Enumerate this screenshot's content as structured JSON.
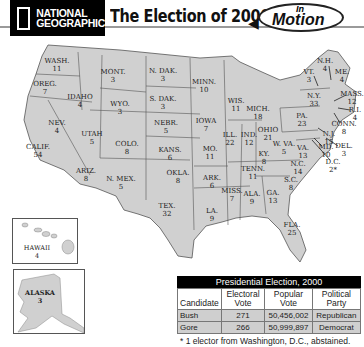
{
  "header": {
    "logo_line1": "NATIONAL",
    "logo_line2": "GEOGRAPHIC",
    "title": "The Election of 2000",
    "badge_small": "In",
    "badge_large": "Motion",
    "badge_icon": "arrow-left-icon"
  },
  "map": {
    "fill_color": "#d0d0d0",
    "border_color": "#555555",
    "states": [
      {
        "name": "WASH.",
        "votes": "11",
        "x": 57,
        "y": 62
      },
      {
        "name": "OREG.",
        "votes": "7",
        "x": 45,
        "y": 85
      },
      {
        "name": "CALIF.",
        "votes": "54",
        "x": 38,
        "y": 148
      },
      {
        "name": "NEV.",
        "votes": "4",
        "x": 57,
        "y": 124
      },
      {
        "name": "IDAHO",
        "votes": "4",
        "x": 80,
        "y": 98
      },
      {
        "name": "MONT.",
        "votes": "3",
        "x": 113,
        "y": 73
      },
      {
        "name": "WYO.",
        "votes": "3",
        "x": 120,
        "y": 105
      },
      {
        "name": "UTAH",
        "votes": "5",
        "x": 92,
        "y": 135
      },
      {
        "name": "COLO.",
        "votes": "8",
        "x": 127,
        "y": 145
      },
      {
        "name": "ARIZ.",
        "votes": "8",
        "x": 86,
        "y": 172
      },
      {
        "name": "N. MEX.",
        "votes": "5",
        "x": 121,
        "y": 180
      },
      {
        "name": "N. DAK.",
        "votes": "3",
        "x": 163,
        "y": 72
      },
      {
        "name": "S. DAK.",
        "votes": "3",
        "x": 163,
        "y": 100
      },
      {
        "name": "NEBR.",
        "votes": "5",
        "x": 166,
        "y": 124
      },
      {
        "name": "KANS.",
        "votes": "6",
        "x": 170,
        "y": 151
      },
      {
        "name": "OKLA.",
        "votes": "8",
        "x": 178,
        "y": 174
      },
      {
        "name": "TEX.",
        "votes": "32",
        "x": 167,
        "y": 207
      },
      {
        "name": "MINN.",
        "votes": "10",
        "x": 204,
        "y": 83
      },
      {
        "name": "IOWA",
        "votes": "7",
        "x": 206,
        "y": 122
      },
      {
        "name": "MO.",
        "votes": "11",
        "x": 210,
        "y": 150
      },
      {
        "name": "ARK.",
        "votes": "6",
        "x": 212,
        "y": 179
      },
      {
        "name": "LA.",
        "votes": "9",
        "x": 212,
        "y": 212
      },
      {
        "name": "WIS.",
        "votes": "11",
        "x": 236,
        "y": 102
      },
      {
        "name": "ILL.",
        "votes": "22",
        "x": 230,
        "y": 136
      },
      {
        "name": "MICH.",
        "votes": "18",
        "x": 258,
        "y": 110
      },
      {
        "name": "IND.",
        "votes": "12",
        "x": 249,
        "y": 136
      },
      {
        "name": "OHIO",
        "votes": "21",
        "x": 268,
        "y": 131
      },
      {
        "name": "KY.",
        "votes": "8",
        "x": 264,
        "y": 155
      },
      {
        "name": "TENN.",
        "votes": "11",
        "x": 253,
        "y": 170
      },
      {
        "name": "MISS.",
        "votes": "7",
        "x": 232,
        "y": 192
      },
      {
        "name": "ALA.",
        "votes": "9",
        "x": 252,
        "y": 195
      },
      {
        "name": "GA.",
        "votes": "13",
        "x": 273,
        "y": 194
      },
      {
        "name": "FLA.",
        "votes": "25",
        "x": 292,
        "y": 226
      },
      {
        "name": "S.C.",
        "votes": "8",
        "x": 291,
        "y": 181
      },
      {
        "name": "N.C.",
        "votes": "14",
        "x": 298,
        "y": 165
      },
      {
        "name": "VA.",
        "votes": "13",
        "x": 303,
        "y": 149
      },
      {
        "name": "W. VA.",
        "votes": "5",
        "x": 284,
        "y": 145
      },
      {
        "name": "PA.",
        "votes": "23",
        "x": 302,
        "y": 117
      },
      {
        "name": "N.Y.",
        "votes": "33",
        "x": 314,
        "y": 97
      },
      {
        "name": "VT.",
        "votes": "3",
        "x": 309,
        "y": 73
      },
      {
        "name": "N.H.",
        "votes": "4",
        "x": 325,
        "y": 62
      },
      {
        "name": "ME.",
        "votes": "4",
        "x": 342,
        "y": 73
      },
      {
        "name": "MASS.",
        "votes": "12",
        "x": 352,
        "y": 95
      },
      {
        "name": "R.I.",
        "votes": "4",
        "x": 355,
        "y": 111
      },
      {
        "name": "CONN.",
        "votes": "8",
        "x": 344,
        "y": 125
      },
      {
        "name": "N.J.",
        "votes": "15",
        "x": 329,
        "y": 135
      },
      {
        "name": "DEL.",
        "votes": "3",
        "x": 344,
        "y": 147
      },
      {
        "name": "MD.",
        "votes": "10",
        "x": 326,
        "y": 148
      },
      {
        "name": "D.C.",
        "votes": "2*",
        "x": 333,
        "y": 163
      }
    ],
    "insets": [
      {
        "name": "HAWAII",
        "votes": "4"
      },
      {
        "name": "ALASKA",
        "votes": "3"
      }
    ]
  },
  "results_table": {
    "title": "Presidential Election, 2000",
    "columns": [
      "Candidate",
      "Electoral Vote",
      "Popular Vote",
      "Political Party"
    ],
    "rows": [
      {
        "candidate": "Bush",
        "electoral": "271",
        "popular": "50,456,002",
        "party": "Republican"
      },
      {
        "candidate": "Gore",
        "electoral": "266",
        "popular": "50,999,897",
        "party": "Democrat"
      }
    ],
    "footnote": "* 1 elector from Washington, D.C., abstained."
  }
}
